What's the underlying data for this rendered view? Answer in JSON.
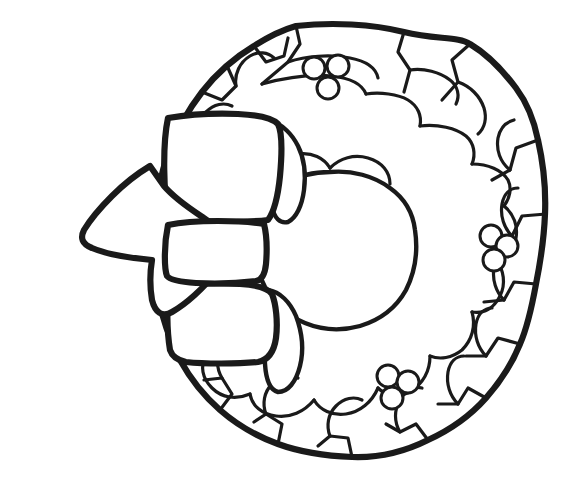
{
  "page": {
    "kind": "line-art",
    "style": "coloring-book outline",
    "width": 582,
    "height": 490,
    "background_color": "#ffffff",
    "line_color": "#1a1a1a"
  },
  "artwork": {
    "subject": "christmas-wreath-with-bow",
    "description": "Black outline drawing of a round evergreen holly wreath with a large ribbon bow at the left and three clusters of holly berries",
    "color_fill_state": "uncolored",
    "elements": [
      {
        "name": "wreath-ring",
        "label": "Wreath ring",
        "shape": "irregular-circle",
        "center": [
          340,
          242
        ],
        "radius_x": 205,
        "radius_y": 215
      },
      {
        "name": "wreath-center-hole",
        "label": "Wreath center opening",
        "shape": "rounded-circle",
        "center": [
          330,
          252
        ],
        "radius": 78
      },
      {
        "name": "ribbon-bow",
        "label": "Ribbon bow",
        "parts": [
          "left-loop",
          "upper-right-loop",
          "lower-right-loop",
          "center-knot"
        ],
        "position": "left"
      },
      {
        "name": "leaf-cluster",
        "label": "Holly leaves",
        "count": 22
      }
    ],
    "berry_clusters": [
      {
        "name": "berry-cluster-top",
        "label": "Top holly berries",
        "count": 3,
        "center": [
          325,
          72
        ]
      },
      {
        "name": "berry-cluster-right",
        "label": "Right holly berries",
        "count": 3,
        "center": [
          500,
          250
        ]
      },
      {
        "name": "berry-cluster-bottom",
        "label": "Bottom holly berries",
        "count": 3,
        "count_label": "3",
        "center": [
          398,
          386
        ]
      }
    ]
  },
  "geometry": {
    "wreath_outer": "M 296 26 C 332 22 372 24 404 32 C 436 40 458 36 470 44 C 490 56 504 72 516 88 C 528 104 534 120 538 140 C 543 162 546 190 545 214 C 544 240 540 264 536 284 C 532 306 528 326 520 344 C 512 364 500 382 486 398 C 470 416 450 430 428 440 C 404 452 378 458 352 457 C 326 456 300 452 278 444 C 256 436 236 424 220 410 C 204 396 190 378 180 360 C 170 340 162 318 158 296 C 154 272 152 248 154 224 C 156 200 160 176 168 154 C 176 132 188 110 202 92 C 216 74 234 58 254 46 C 268 37 282 30 296 26 Z",
    "wreath_inner": "M 330 172 C 352 170 374 176 390 188 C 404 198 413 213 415 230 C 418 250 415 272 406 290 C 396 308 380 320 360 326 C 342 331 322 330 305 323 C 288 316 274 303 265 287 C 256 270 253 250 257 231 C 261 212 272 194 288 183 C 300 175 315 172 330 172 Z",
    "bow_left_loop": "M 150 166 C 140 172 124 184 112 196 C 100 208 90 220 84 230 C 80 238 82 244 92 248 C 106 254 130 258 152 260 C 150 272 150 288 152 300 C 155 312 162 318 172 312 C 186 304 204 288 216 272 C 224 262 228 252 226 244 C 224 235 216 226 204 218 C 192 210 176 200 164 186 Z",
    "bow_knot": "M 168 225 C 182 222 200 221 218 221 C 236 221 252 222 264 224 C 267 236 267 252 266 264 C 265 274 262 280 256 281 C 240 283 216 284 196 283 C 180 282 170 280 167 276 C 164 268 164 244 168 225 Z",
    "bow_upper_loop": "M 168 118 C 186 115 214 113 238 114 C 258 115 272 118 278 124 C 282 132 282 154 280 176 C 278 196 274 212 268 220 C 252 222 216 222 190 221 C 178 220 170 218 168 214 C 164 196 162 146 168 118 Z",
    "bow_lower_loop": "M 170 286 C 186 284 216 283 240 284 C 258 285 268 288 272 294 C 276 304 278 322 276 338 C 274 352 268 360 258 362 C 238 364 204 364 186 362 C 176 360 172 356 170 350 C 167 332 166 302 170 286 Z",
    "bow_tail_upper": "M 272 122 C 282 124 292 134 298 146 C 304 158 306 174 304 190 C 302 206 296 218 288 222 C 280 224 274 218 272 206 C 269 188 268 150 272 122 Z",
    "bow_tail_lower": "M 268 290 C 280 292 290 302 296 316 C 302 332 304 350 300 366 C 296 382 288 392 278 392 C 270 390 266 380 265 364 C 263 340 264 308 268 290 Z"
  },
  "leaf_veins": [
    "M 296 26 L 300 44 L 288 62 L 262 84",
    "M 404 32 L 398 52 L 410 70 L 404 92",
    "M 470 44 L 452 60 L 458 82 L 442 100",
    "M 538 140 L 516 148 L 510 170 L 492 180",
    "M 546 214 L 522 216 L 512 236 L 494 240",
    "M 536 284 L 514 282 L 504 300 L 484 302",
    "M 520 344 L 498 338 L 486 356 L 466 356",
    "M 486 398 L 468 388 L 458 404 L 438 404",
    "M 428 440 L 416 424 L 400 432 L 386 424",
    "M 352 457 L 348 438 L 330 436 L 318 446",
    "M 278 444 L 282 424 L 266 414 L 254 422",
    "M 220 410 L 232 394 L 222 378 L 204 380",
    "M 180 360 L 200 354 L 206 336 L 192 322",
    "M 158 296 L 180 294 L 188 276 L 174 262",
    "M 154 224 L 176 226 L 186 208 L 172 194",
    "M 168 154 L 190 158 L 200 142 L 188 126",
    "M 202 92 L 222 100 L 236 86 L 228 68",
    "M 254 46 L 266 62 L 284 56 L 288 38"
  ],
  "inner_segments": [
    "M 262 84 C 284 78 310 74 332 76 C 350 78 362 84 366 94",
    "M 366 94 C 380 92 398 94 408 100 C 418 106 422 116 420 126",
    "M 420 126 C 438 124 456 128 466 136 C 474 143 476 154 472 164",
    "M 472 164 C 488 164 502 170 508 180 C 512 188 510 198 504 206",
    "M 504 206 C 514 214 518 226 516 238 C 514 250 506 258 496 260",
    "M 496 260 C 504 270 506 284 500 296 C 494 308 484 314 472 312",
    "M 472 312 C 476 326 472 340 462 350 C 452 358 440 360 430 356",
    "M 430 356 C 430 372 422 384 410 392 C 398 398 386 396 378 388",
    "M 378 388 C 372 402 360 412 346 414 C 332 416 320 410 314 400",
    "M 314 400 C 304 412 290 418 276 416 C 262 414 252 406 250 394",
    "M 250 394 C 236 400 222 398 212 388 C 202 378 200 366 206 356",
    "M 206 356 C 192 356 180 348 176 336 C 172 324 176 312 186 306",
    "M 186 306 C 174 300 168 288 170 276 C 172 262 182 254 194 254",
    "M 194 254 C 186 244 184 230 190 220 C 196 208 208 204 220 208",
    "M 220 208 C 218 194 224 180 236 174 C 248 168 260 170 268 180",
    "M 268 180 C 272 166 284 156 298 154 C 312 152 324 158 330 168",
    "M 330 168 C 340 158 354 154 368 158 C 382 162 390 172 390 184",
    "M 288 62 C 306 56 330 54 350 58 C 366 61 376 68 378 78",
    "M 410 70 C 424 68 440 72 450 80 C 458 86 460 96 456 104",
    "M 458 82 C 470 86 480 96 484 108 C 487 118 485 128 478 134",
    "M 510 170 C 500 162 496 150 498 138 C 500 128 506 122 514 120",
    "M 512 236 C 504 228 500 216 502 204 C 504 194 510 188 518 188",
    "M 504 300 C 496 292 492 280 494 268 C 496 258 502 252 510 252",
    "M 486 356 C 478 348 474 336 476 324 C 478 314 484 308 492 308",
    "M 458 404 C 450 396 446 384 448 372 C 450 362 456 356 464 356",
    "M 400 432 C 394 422 394 410 400 400 C 406 390 414 386 422 388",
    "M 330 436 C 326 426 328 414 336 406 C 344 398 354 396 362 400",
    "M 266 414 C 262 404 264 392 272 384 C 280 376 290 374 298 378",
    "M 222 378 C 216 368 216 356 222 346 C 228 338 238 334 246 338",
    "M 206 336 C 198 328 194 316 196 304 C 198 294 204 288 212 288",
    "M 188 276 C 182 266 182 254 188 244 C 194 236 202 232 210 234",
    "M 186 208 C 180 198 180 186 186 176 C 192 168 200 164 208 166",
    "M 200 142 C 196 132 198 120 206 112 C 214 104 224 102 232 106",
    "M 236 86 C 234 74 240 62 250 56 C 258 51 268 52 274 58"
  ],
  "berries": {
    "radius": 11,
    "top": [
      [
        314,
        68
      ],
      [
        338,
        66
      ],
      [
        328,
        88
      ]
    ],
    "right": [
      [
        491,
        236
      ],
      [
        507,
        246
      ],
      [
        494,
        260
      ]
    ],
    "bottom": [
      [
        388,
        376
      ],
      [
        408,
        382
      ],
      [
        392,
        398
      ]
    ]
  },
  "toolbar": {
    "visible": false
  }
}
